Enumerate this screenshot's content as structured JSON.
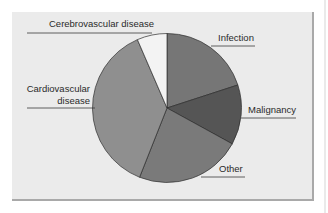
{
  "chart_data": {
    "type": "pie",
    "title": "",
    "slices": [
      {
        "label": "Infection",
        "value": 20,
        "color": "#767676"
      },
      {
        "label": "Malignancy",
        "value": 13,
        "color": "#555555"
      },
      {
        "label": "Other",
        "value": 23,
        "color": "#7a7a7a"
      },
      {
        "label": "Cardiovascular disease",
        "value": 37.5,
        "color": "#8f8f8f"
      },
      {
        "label": "Cerebrovascular disease",
        "value": 6.5,
        "color": "#f3f3f3"
      }
    ],
    "start_angle_deg": 0,
    "direction": "clockwise",
    "legend": "none (direct labels with leader lines)"
  },
  "labels": {
    "infection": "Infection",
    "malignancy": "Malignancy",
    "other": "Other",
    "cardiovascular_line1": "Cardiovascular",
    "cardiovascular_line2": "disease",
    "cerebrovascular": "Cerebrovascular disease"
  }
}
